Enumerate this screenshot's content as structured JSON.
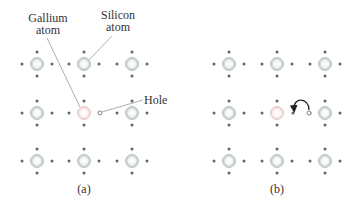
{
  "labels": {
    "gallium_line1": "Gallium",
    "gallium_line2": "atom",
    "silicon_line1": "Silicon",
    "silicon_line2": "atom",
    "hole": "Hole",
    "panel_a": "(a)",
    "panel_b": "(b)"
  },
  "colors": {
    "silicon_atom_fill": "#e9eeec",
    "silicon_atom_stroke": "#b8c2bf",
    "gallium_atom_fill": "#fbeeee",
    "gallium_atom_stroke": "#e8c8c8",
    "electron": "#666666",
    "leader": "#999999",
    "arrow": "#222222"
  },
  "panels": [
    {
      "id": "a",
      "columns_x": [
        37,
        84,
        132
      ],
      "rows_y": [
        64,
        113,
        161
      ],
      "gallium_position": [
        1,
        1
      ],
      "hole_at": [
        100,
        113
      ]
    },
    {
      "id": "b",
      "columns_x": [
        229,
        277,
        325
      ],
      "rows_y": [
        64,
        113,
        161
      ],
      "gallium_position": [
        1,
        1
      ],
      "hole_at": [
        309,
        113
      ],
      "arrow": {
        "from": [
          309,
          113
        ],
        "to": [
          293,
          113
        ]
      }
    }
  ]
}
